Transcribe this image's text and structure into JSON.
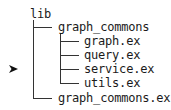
{
  "tree": {
    "root": {
      "label": "lib"
    },
    "folder": {
      "label": "graph_commons"
    },
    "children": [
      {
        "label": "graph.ex"
      },
      {
        "label": "query.ex"
      },
      {
        "label": "service.ex",
        "selected": true
      },
      {
        "label": "utils.ex"
      }
    ],
    "sibling": {
      "label": "graph_commons.ex"
    }
  },
  "pointer": {
    "icon": "arrow-right-icon",
    "target": "service.ex"
  }
}
